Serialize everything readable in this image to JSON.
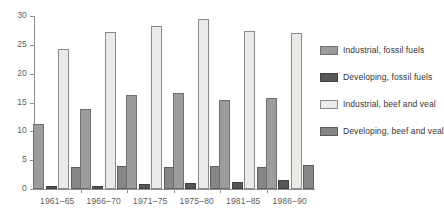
{
  "chart_data": {
    "type": "bar",
    "title": "",
    "subtitle": "",
    "xlabel": "",
    "ylabel": "",
    "ylim": [
      0,
      30
    ],
    "yticks": [
      0,
      5,
      10,
      15,
      20,
      25,
      30
    ],
    "grid": false,
    "legend_position": "right",
    "categories": [
      "1961–65",
      "1966–70",
      "1971–75",
      "1975–80",
      "1981–85",
      "1986–90"
    ],
    "series": [
      {
        "name": "Industrial, fossil fuels",
        "color": "#9c9c9c",
        "values": [
          11.3,
          13.9,
          16.3,
          16.7,
          15.4,
          15.8
        ]
      },
      {
        "name": "Developing, fossil fuels",
        "color": "#575757",
        "values": [
          0.6,
          0.6,
          0.9,
          1.1,
          1.3,
          1.5
        ]
      },
      {
        "name": "Industrial, beef and veal",
        "color": "#eaeae6",
        "values": [
          24.3,
          27.2,
          28.2,
          29.5,
          27.4,
          27.0
        ]
      },
      {
        "name": "Developing, beef and veal",
        "color": "#868686",
        "values": [
          3.85,
          4.05,
          3.75,
          4.0,
          3.85,
          4.1
        ]
      }
    ]
  },
  "legend": {
    "items": [
      {
        "label": "Industrial, fossil fuels"
      },
      {
        "label": "Developing, fossil fuels"
      },
      {
        "label": "Industrial, beef and veal"
      },
      {
        "label": "Developing, beef and veal"
      }
    ]
  }
}
